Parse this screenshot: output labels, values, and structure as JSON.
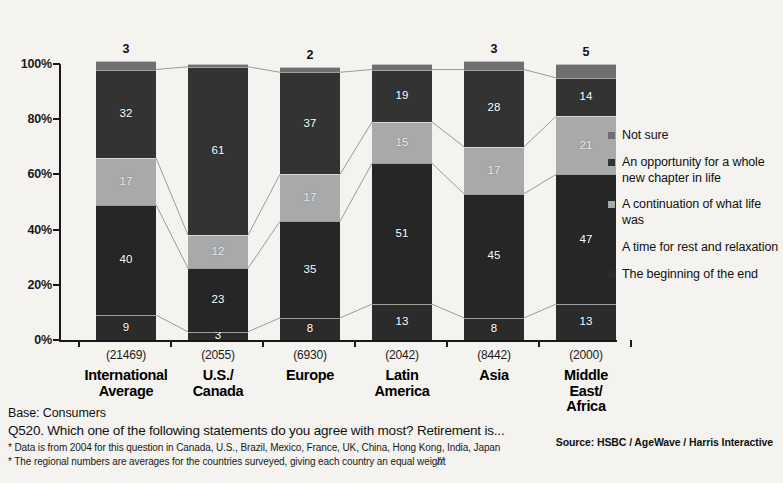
{
  "chart_data": {
    "type": "bar",
    "subtype": "stacked-100-percent",
    "title": "",
    "xlabel": "",
    "ylabel": "",
    "ylim": [
      0,
      100
    ],
    "y_ticks": [
      "0%",
      "20%",
      "40%",
      "60%",
      "80%",
      "100%"
    ],
    "grid": false,
    "legend_position": "right",
    "categories": [
      "International Average",
      "U.S./ Canada",
      "Europe",
      "Latin America",
      "Asia",
      "Middle East/ Africa"
    ],
    "category_bases": [
      "(21469)",
      "(2055)",
      "(6930)",
      "(2042)",
      "(8442)",
      "(2000)"
    ],
    "series": [
      {
        "name": "The beginning of the end",
        "values": [
          9,
          3,
          8,
          13,
          8,
          13
        ]
      },
      {
        "name": "A time for rest and relaxation",
        "values": [
          40,
          23,
          35,
          51,
          45,
          47
        ]
      },
      {
        "name": "A continuation of what life was",
        "values": [
          17,
          12,
          17,
          15,
          17,
          21
        ]
      },
      {
        "name": "An opportunity for a whole new chapter in life",
        "values": [
          32,
          61,
          37,
          19,
          28,
          14
        ]
      },
      {
        "name": "Not sure",
        "values": [
          3,
          1,
          2,
          2,
          3,
          5
        ]
      }
    ],
    "series_colors": [
      "#2b2b2b",
      "#262626",
      "#a9a9a9",
      "#333333",
      "#6f6f6f"
    ],
    "bar_top_labels": [
      "3",
      "",
      "2",
      "",
      "3",
      "5"
    ],
    "segment_labels": [
      [
        "9",
        "40",
        "17",
        "32",
        ""
      ],
      [
        "3",
        "23",
        "12",
        "61",
        ""
      ],
      [
        "8",
        "35",
        "17",
        "37",
        ""
      ],
      [
        "13",
        "51",
        "15",
        "19",
        ""
      ],
      [
        "8",
        "45",
        "17",
        "28",
        ""
      ],
      [
        "13",
        "47",
        "21",
        "14",
        ""
      ]
    ]
  },
  "legend": {
    "items": [
      {
        "label": "Not sure",
        "color": "#6f6f6f"
      },
      {
        "label": "An opportunity for a whole new chapter in life",
        "color": "#333333"
      },
      {
        "label": "A continuation of what life was",
        "color": "#a9a9a9"
      },
      {
        "label": "A time for rest and relaxation",
        "color": "#262626"
      },
      {
        "label": "The beginning of the end",
        "color": "#2b2b2b"
      }
    ]
  },
  "footer": {
    "base": "Base: Consumers",
    "question": "Q520. Which one of the following statements do you agree with most? Retirement is...",
    "note1": "* Data is from 2004 for this question in Canada, U.S., Brazil, Mexico, France, UK, China, Hong Kong, India, Japan",
    "note2": "* The regional numbers are averages for the countries surveyed, giving each country an equal weight",
    "mark": "//",
    "source": "Source:  HSBC / AgeWave / Harris Interactive"
  }
}
